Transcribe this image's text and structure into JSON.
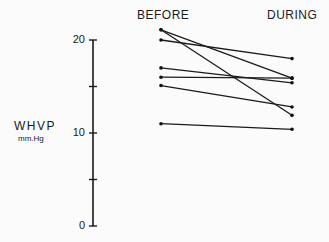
{
  "chart_data": {
    "type": "line",
    "title": "",
    "categories": [
      "BEFORE",
      "DURING"
    ],
    "ylabel": "WHVP",
    "ylabel_unit": "mm.Hg",
    "ylim": [
      0,
      20
    ],
    "yticks_labeled": [
      0,
      10,
      20
    ],
    "yticks_minor": [
      5,
      15
    ],
    "grid": false,
    "legend": null,
    "series": [
      {
        "name": "1",
        "values": [
          21.1,
          15.9
        ]
      },
      {
        "name": "2",
        "values": [
          21.1,
          11.9
        ]
      },
      {
        "name": "3",
        "values": [
          20.0,
          18.0
        ]
      },
      {
        "name": "4",
        "values": [
          17.0,
          15.4
        ]
      },
      {
        "name": "5",
        "values": [
          16.0,
          15.9
        ]
      },
      {
        "name": "6",
        "values": [
          15.1,
          12.8
        ]
      },
      {
        "name": "7",
        "values": [
          11.0,
          10.4
        ]
      }
    ]
  },
  "labels": {
    "before": "BEFORE",
    "during": "DURING",
    "ylabel": "WHVP",
    "yunit": "mm.Hg",
    "tick20": "20",
    "tick10": "10",
    "tick0": "0"
  }
}
